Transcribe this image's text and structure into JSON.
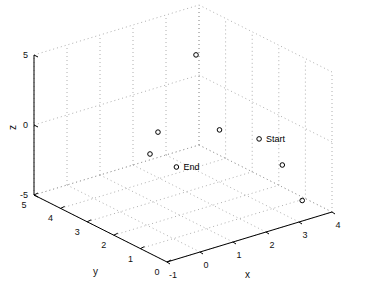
{
  "chart_data": {
    "type": "scatter",
    "projection": "3d",
    "title": "",
    "xlabel": "x",
    "ylabel": "y",
    "zlabel": "z",
    "xlim": [
      -1,
      4
    ],
    "ylim": [
      0,
      5
    ],
    "zlim": [
      -5,
      5
    ],
    "x_ticks": [
      -1,
      0,
      1,
      2,
      3,
      4
    ],
    "y_ticks": [
      0,
      1,
      2,
      3,
      4,
      5
    ],
    "z_ticks": [
      -5,
      0,
      5
    ],
    "grid": true,
    "marker": "o",
    "points": [
      {
        "x": 3.0,
        "y": 1.5,
        "z": -0.5,
        "label": "Start"
      },
      {
        "x": 2.7,
        "y": 3.5,
        "z": 3.8,
        "label": ""
      },
      {
        "x": 0.5,
        "y": 2.2,
        "z": 1.1,
        "label": ""
      },
      {
        "x": 1.8,
        "y": 1.5,
        "z": 1.0,
        "label": ""
      },
      {
        "x": 0.5,
        "y": 2.5,
        "z": -0.75,
        "label": ""
      },
      {
        "x": 3.3,
        "y": 1.0,
        "z": -2.1,
        "label": ""
      },
      {
        "x": 3.5,
        "y": 0.5,
        "z": -4.3,
        "label": ""
      },
      {
        "x": 1.3,
        "y": 2.5,
        "z": -2.25,
        "label": "End"
      }
    ]
  }
}
